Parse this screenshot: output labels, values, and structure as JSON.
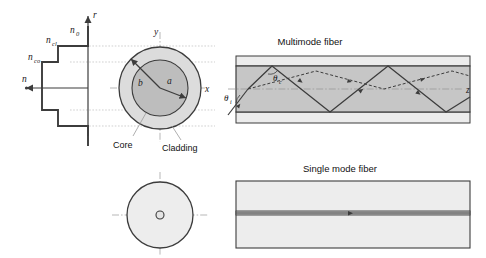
{
  "figure": {
    "topic": "optical-fiber-structure-and-ray-propagation",
    "background_color": "#ffffff",
    "line_color": "#3c3c3c",
    "core_fill": "#b8b8b8",
    "cladding_fill": "#d8d8d8",
    "buffer_fill": "#eeeeee",
    "grid_color": "#bbbbbb"
  },
  "index_profile": {
    "axis_vertical_label": "r",
    "axis_horizontal_label": "n",
    "levels": [
      {
        "label": "n_0",
        "text": "n",
        "sub": "0"
      },
      {
        "label": "n_cl",
        "text": "n",
        "sub": "cl"
      },
      {
        "label": "n_co",
        "text": "n",
        "sub": "co"
      }
    ]
  },
  "cross_section_multimode": {
    "axis_x_label": "x",
    "axis_y_label": "y",
    "radius_core_label": "a",
    "radius_cladding_label": "b",
    "callout_core": "Core",
    "callout_cladding": "Cladding"
  },
  "cross_section_singlemode": {
    "core_dot": "core"
  },
  "multimode_panel": {
    "title": "Multimode fiber",
    "axis_label": "z",
    "angle_incidence": {
      "text": "θ",
      "sub": "i"
    },
    "angle_critical": {
      "text": "θ",
      "sub": "c"
    }
  },
  "singlemode_panel": {
    "title": "Single mode fiber"
  }
}
